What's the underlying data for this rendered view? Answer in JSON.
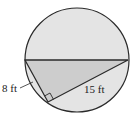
{
  "diagram": {
    "type": "circle-with-inscribed-right-triangle",
    "labels": {
      "short_leg": "8 ft",
      "long_leg": "15 ft"
    },
    "colors": {
      "circle_fill": "#e4e4e4",
      "triangle_fill": "#cdcdcd",
      "stroke": "#2a2a2a",
      "background": "#ffffff"
    }
  }
}
